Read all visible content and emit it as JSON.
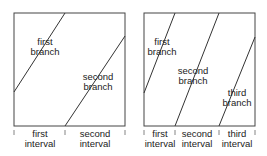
{
  "diagrams": [
    {
      "branches": [
        {
          "line1": "first",
          "line2": "branch"
        },
        {
          "line1": "second",
          "line2": "branch"
        }
      ],
      "intervals": [
        {
          "line1": "first",
          "line2": "interval"
        },
        {
          "line1": "second",
          "line2": "interval"
        }
      ]
    },
    {
      "branches": [
        {
          "line1": "first",
          "line2": "branch"
        },
        {
          "line1": "second",
          "line2": "branch"
        },
        {
          "line1": "third",
          "line2": "branch"
        }
      ],
      "intervals": [
        {
          "line1": "first",
          "line2": "interval"
        },
        {
          "line1": "second",
          "line2": "interval"
        },
        {
          "line1": "third",
          "line2": "interval"
        }
      ]
    }
  ],
  "colors": {
    "line": "#333333",
    "text": "#222222"
  }
}
